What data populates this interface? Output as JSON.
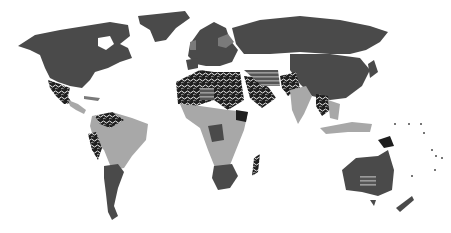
{
  "map": {
    "type": "world-choropleth",
    "style": "grayscale",
    "colors": {
      "background": "#ffffff",
      "dark": "#4a4a4a",
      "medium": "#7a7a7a",
      "light": "#a8a8a8",
      "black": "#1e1e1e",
      "pattern_fg": "#ffffff"
    },
    "categories": [
      {
        "name": "dark",
        "pattern": "solid-dark"
      },
      {
        "name": "medium",
        "pattern": "solid-medium"
      },
      {
        "name": "light",
        "pattern": "solid-light"
      },
      {
        "name": "black",
        "pattern": "solid-black"
      },
      {
        "name": "speckled",
        "pattern": "white-squiggle-on-black"
      },
      {
        "name": "striped",
        "pattern": "horizontal-stripes"
      }
    ],
    "regions": [
      {
        "id": "north-america",
        "category": "dark"
      },
      {
        "id": "greenland",
        "category": "dark"
      },
      {
        "id": "mexico",
        "category": "speckled"
      },
      {
        "id": "central-america",
        "category": "light"
      },
      {
        "id": "colombia-venezuela",
        "category": "speckled"
      },
      {
        "id": "peru-ecuador",
        "category": "speckled"
      },
      {
        "id": "brazil",
        "category": "light"
      },
      {
        "id": "argentina-chile",
        "category": "dark"
      },
      {
        "id": "europe",
        "category": "dark"
      },
      {
        "id": "scandinavia-east",
        "category": "medium"
      },
      {
        "id": "russia",
        "category": "dark"
      },
      {
        "id": "china",
        "category": "dark"
      },
      {
        "id": "north-africa-west",
        "category": "speckled"
      },
      {
        "id": "north-africa-central",
        "category": "striped"
      },
      {
        "id": "middle-east",
        "category": "speckled"
      },
      {
        "id": "iran",
        "category": "striped"
      },
      {
        "id": "afghanistan-pakistan",
        "category": "speckled"
      },
      {
        "id": "india",
        "category": "light"
      },
      {
        "id": "southeast-asia",
        "category": "speckled"
      },
      {
        "id": "indonesia",
        "category": "light"
      },
      {
        "id": "central-africa",
        "category": "light"
      },
      {
        "id": "southern-africa",
        "category": "dark"
      },
      {
        "id": "madagascar",
        "category": "speckled"
      },
      {
        "id": "australia",
        "category": "dark"
      },
      {
        "id": "australia-center",
        "category": "striped"
      },
      {
        "id": "new-zealand",
        "category": "dark"
      },
      {
        "id": "papua",
        "category": "black"
      }
    ]
  }
}
